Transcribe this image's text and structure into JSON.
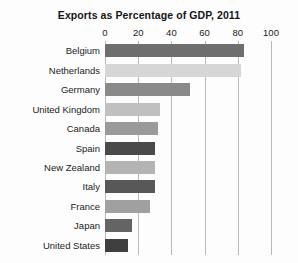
{
  "chart_data": {
    "type": "bar",
    "orientation": "horizontal",
    "title": "Exports as Percentage of GDP, 2011",
    "xlabel": "",
    "ylabel": "",
    "xlim": [
      0,
      100
    ],
    "xticks": [
      0,
      20,
      40,
      60,
      80,
      100
    ],
    "xtick_labels": [
      "0",
      "20",
      "40",
      "60",
      "80",
      "100"
    ],
    "grid": true,
    "grid_axis": "x",
    "legend": false,
    "categories": [
      "Belgium",
      "Netherlands",
      "Germany",
      "United Kingdom",
      "Canada",
      "Spain",
      "New Zealand",
      "Italy",
      "France",
      "Japan",
      "United States"
    ],
    "values": [
      84,
      82,
      51,
      33,
      32,
      30,
      30,
      30,
      27,
      16,
      14
    ],
    "bar_colors": [
      "#6e6e6e",
      "#d6d6d6",
      "#8a8a8a",
      "#c0c0c0",
      "#9a9a9a",
      "#4a4a4a",
      "#b4b4b4",
      "#585858",
      "#a0a0a0",
      "#646464",
      "#3f3f3f"
    ],
    "background_color": "#fdfdfd",
    "gridline_color": "#b9b9b9",
    "text_color": "#1c1c1c"
  }
}
